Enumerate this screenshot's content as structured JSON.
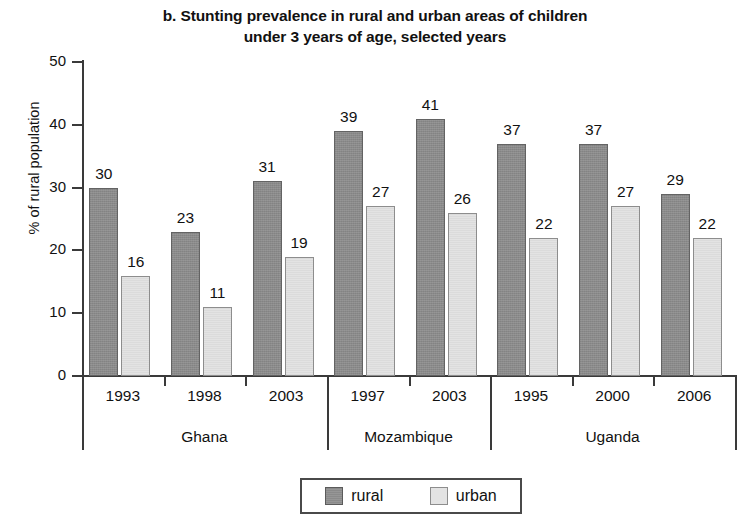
{
  "chart_data": {
    "type": "bar",
    "title": "b. Stunting prevalence in rural and urban areas of children under 3 years of age, selected years",
    "title_lines": [
      "b. Stunting prevalence in rural and urban areas of children",
      "under 3 years of age, selected years"
    ],
    "xlabel": "",
    "ylabel": "% of rural population",
    "ylim": [
      0,
      50
    ],
    "ytick_labels": [
      "0",
      "10",
      "20",
      "30",
      "40",
      "50"
    ],
    "ytick_values": [
      0,
      10,
      20,
      30,
      40,
      50
    ],
    "grid": false,
    "legend_position": "bottom-center",
    "categories": [
      "1993",
      "1998",
      "2003",
      "1997",
      "2003",
      "1995",
      "2000",
      "2006"
    ],
    "groups": [
      {
        "country": "Ghana",
        "years": [
          "1993",
          "1998",
          "2003"
        ]
      },
      {
        "country": "Mozambique",
        "years": [
          "1997",
          "2003"
        ]
      },
      {
        "country": "Uganda",
        "years": [
          "1995",
          "2000",
          "2006"
        ]
      }
    ],
    "series": [
      {
        "name": "rural",
        "color": "#8a8a8a",
        "values": [
          30,
          23,
          31,
          39,
          41,
          37,
          37,
          29
        ]
      },
      {
        "name": "urban",
        "color": "#e3e3e3",
        "values": [
          16,
          11,
          19,
          27,
          26,
          22,
          27,
          22
        ]
      }
    ],
    "bars": [
      {
        "country": "Ghana",
        "year": "1993",
        "rural": 30,
        "urban": 16
      },
      {
        "country": "Ghana",
        "year": "1998",
        "rural": 23,
        "urban": 11
      },
      {
        "country": "Ghana",
        "year": "2003",
        "rural": 31,
        "urban": 19
      },
      {
        "country": "Mozambique",
        "year": "1997",
        "rural": 39,
        "urban": 27
      },
      {
        "country": "Mozambique",
        "year": "2003",
        "rural": 41,
        "urban": 26
      },
      {
        "country": "Uganda",
        "year": "1995",
        "rural": 37,
        "urban": 22
      },
      {
        "country": "Uganda",
        "year": "2000",
        "rural": 37,
        "urban": 27
      },
      {
        "country": "Uganda",
        "year": "2006",
        "rural": 29,
        "urban": 22
      }
    ],
    "legend": [
      {
        "label": "rural",
        "color": "#8a8a8a"
      },
      {
        "label": "urban",
        "color": "#e3e3e3"
      }
    ]
  }
}
